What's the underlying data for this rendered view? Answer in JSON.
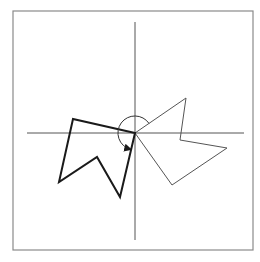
{
  "diagram": {
    "type": "geometric-transformation",
    "colors": {
      "background": "#ffffff",
      "frame": "#8a8a8a",
      "axes": "#555555",
      "original_shape": "#555555",
      "rotated_shape": "#1a1a1a",
      "rotation_marker": "#333333"
    },
    "frame": {
      "x": 13,
      "y": 11,
      "width": 240,
      "height": 239
    },
    "origin": {
      "x": 135,
      "y": 133
    },
    "axes": {
      "horizontal": {
        "x1": 27,
        "y1": 133,
        "x2": 244,
        "y2": 133
      },
      "vertical": {
        "x1": 135,
        "y1": 22,
        "x2": 135,
        "y2": 240
      }
    },
    "original_shape": {
      "label": "original polygon",
      "points": [
        [
          135,
          133
        ],
        [
          186,
          98
        ],
        [
          180,
          140
        ],
        [
          227,
          148
        ],
        [
          172,
          185
        ]
      ]
    },
    "rotated_shape": {
      "label": "rotated polygon (image)",
      "points": [
        [
          135,
          133
        ],
        [
          73,
          119
        ],
        [
          59,
          182
        ],
        [
          97,
          157
        ],
        [
          120,
          197
        ]
      ]
    },
    "rotation_marker": {
      "center": [
        135,
        133
      ],
      "radius": 17,
      "direction": "clockwise",
      "arrow_tip": [
        130,
        150
      ]
    }
  }
}
